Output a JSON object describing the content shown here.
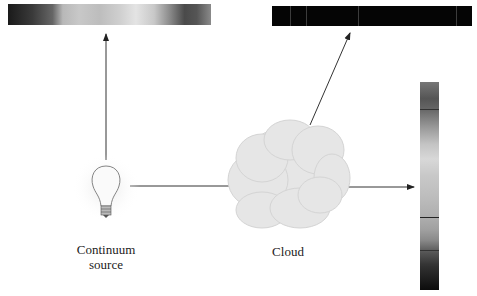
{
  "labels": {
    "source": "Continuum\nsource",
    "source_line1": "Continuum",
    "source_line2": "source",
    "cloud": "Cloud"
  },
  "spectra": {
    "continuous": {
      "position": "top-left",
      "type": "continuous"
    },
    "emission": {
      "position": "top-right",
      "type": "emission",
      "line_positions_pct": [
        9,
        17,
        43,
        92
      ]
    },
    "absorption": {
      "position": "right",
      "type": "absorption",
      "line_positions_pct": [
        13,
        65,
        81,
        88
      ]
    }
  },
  "colors": {
    "line": "#333333",
    "cloud": "#e4e4e4",
    "bulb_glow": "#f0f0f0"
  }
}
